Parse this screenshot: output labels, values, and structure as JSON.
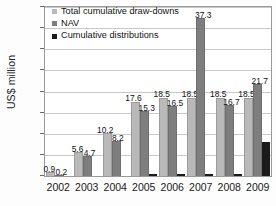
{
  "chart_data": {
    "type": "bar",
    "title": "",
    "xlabel": "",
    "ylabel": "US$ million",
    "ylim": [
      0,
      40
    ],
    "ytick_step": 5,
    "grid": true,
    "legend_position": "top-left",
    "categories": [
      "2002",
      "2003",
      "2004",
      "2005",
      "2006",
      "2007",
      "2008",
      "2009"
    ],
    "series": [
      {
        "name": "Total cumulative draw-downs",
        "color": "#b9b9b9",
        "values": [
          0.9,
          5.6,
          10.2,
          17.6,
          18.5,
          18.5,
          18.5,
          18.5
        ]
      },
      {
        "name": "NAV",
        "color": "#7e7e7e",
        "values": [
          0.2,
          4.7,
          8.2,
          15.3,
          16.5,
          37.3,
          16.7,
          21.7
        ]
      },
      {
        "name": "Cumulative distributions",
        "color": "#1b1b1b",
        "values": [
          0.0,
          0.0,
          0.0,
          0.4,
          0.5,
          0.5,
          0.5,
          8.0
        ]
      }
    ],
    "ytick_labels": [
      "0",
      "5",
      "10",
      "15",
      "20",
      "25",
      "30",
      "35",
      "40"
    ],
    "data_labels": {
      "2002": [
        "0.9",
        "0.2"
      ],
      "2003": [
        "5.6",
        "4.7"
      ],
      "2004": [
        "10.2",
        "8.2"
      ],
      "2005": [
        "17.6",
        "15.3"
      ],
      "2006": [
        "18.5",
        "16.5"
      ],
      "2007": [
        "18.5",
        "37.3"
      ],
      "2008": [
        "18.5",
        "16.7"
      ],
      "2009": [
        "18.5",
        "21.7"
      ]
    }
  }
}
